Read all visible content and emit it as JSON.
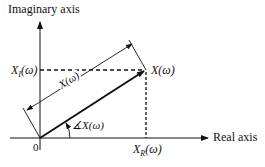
{
  "diagram": {
    "y_axis_label": "Imaginary axis",
    "x_axis_label": "Real axis",
    "origin_label": "0",
    "imag_component_label": "X",
    "imag_component_sub": "I",
    "imag_component_arg": "(ω)",
    "real_component_label": "X",
    "real_component_sub": "R",
    "real_component_arg": "(ω)",
    "point_label": "X(ω)",
    "magnitude_label": "X(ω)",
    "angle_label": "∡X(ω)"
  }
}
